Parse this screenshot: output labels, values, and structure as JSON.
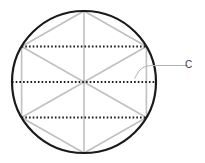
{
  "figure": {
    "label": "C",
    "paths": {
      "circle": "M 12 82 a 72 71 0 1 0 144 0 a 72 71 0 1 0 -144 0",
      "hexagon": "M 84 11 L 146.4 46.5 L 146.4 117.5 L 84 153 L 21.6 117.5 L 21.6 46.5 Z",
      "diagonal_vertical": "M 84 11 L 84 153",
      "diagonal_nw_se": "M 21.6 46.5 L 146.4 117.5",
      "diagonal_ne_sw": "M 146.4 46.5 L 21.6 117.5",
      "dotted_chord_top": "M 21.6 46.5 L 146.4 46.5",
      "dotted_diameter": "M 12 82 L 156 82",
      "dotted_chord_bottom": "M 21.6 117.5 L 146.4 117.5",
      "leader": "M 188 65.5 L 150.5 65.5 Q 143.5 66 139 71 L 134.5 78.5"
    }
  },
  "colors": {
    "background": "#ffffff",
    "circle_stroke": "#1a1a1a",
    "figure_lines": "#c0c0c0",
    "dotted_lines": "#1a1a1a",
    "leader_line": "#b3b3b3",
    "label_text": "#3d3d3d"
  }
}
